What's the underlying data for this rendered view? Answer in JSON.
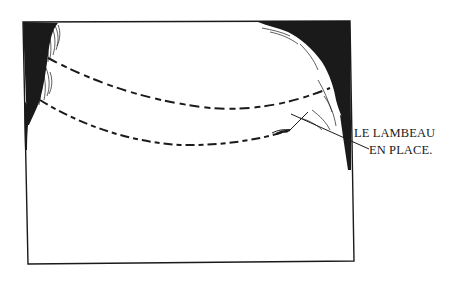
{
  "figure": {
    "type": "surgical-illustration",
    "annotation": {
      "line1": "LE LAMBEAU",
      "line2": "EN PLACE."
    },
    "colors": {
      "ink": "#1a1a1a",
      "background": "#ffffff"
    }
  }
}
